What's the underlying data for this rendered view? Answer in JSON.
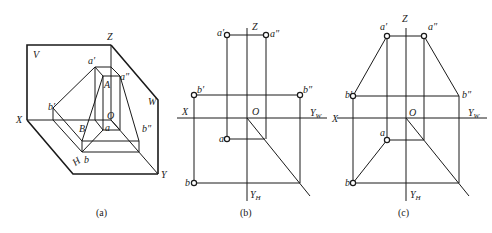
{
  "figure": {
    "panel_a": {
      "caption": "(a)",
      "labels": {
        "V": "V",
        "Z": "Z",
        "W": "W",
        "X": "X",
        "Y": "Y",
        "H": "H",
        "O": "O",
        "a_prime": "a′",
        "a_double_prime": "a″",
        "A": "A",
        "B": "B",
        "b_prime": "b′",
        "b_double_prime": "b″",
        "a": "a",
        "b": "b"
      }
    },
    "panel_b": {
      "caption": "(b)",
      "labels": {
        "Z": "Z",
        "X": "X",
        "O": "O",
        "YW": "Y",
        "YW_sub": "W",
        "YH": "Y",
        "YH_sub": "H",
        "a_prime": "a′",
        "a_double_prime": "a″",
        "b_prime": "b′",
        "b_double_prime": "b″",
        "a": "a",
        "b": "b"
      }
    },
    "panel_c": {
      "caption": "(c)",
      "labels": {
        "Z": "Z",
        "X": "X",
        "O": "O",
        "YW": "Y",
        "YW_sub": "W",
        "YH": "Y",
        "YH_sub": "H",
        "a_prime": "a′",
        "a_double_prime": "a″",
        "b_prime": "b′",
        "b_double_prime": "b″",
        "a": "a",
        "b": "b"
      }
    },
    "colors": {
      "line": "#1a1a1a",
      "background": "#ffffff"
    }
  }
}
